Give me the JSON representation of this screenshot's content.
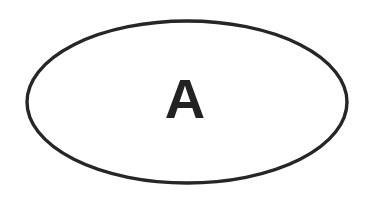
{
  "canvas": {
    "width": 374,
    "height": 198,
    "background_color": "#ffffff"
  },
  "diagram": {
    "type": "single-shape-diagram",
    "shape": {
      "name": "ellipse",
      "kind": "oval",
      "center_x": 187,
      "center_y": 102,
      "radius_x": 160,
      "radius_y": 81,
      "stroke_color": "#262626",
      "stroke_width": 3.4,
      "fill_color": "#ffffff",
      "fill": "none"
    },
    "label": {
      "text": "A",
      "color": "#222222",
      "center_x": 185,
      "baseline_y": 118,
      "cap_height": 40,
      "weight": "bold",
      "style": "sans-serif"
    }
  }
}
